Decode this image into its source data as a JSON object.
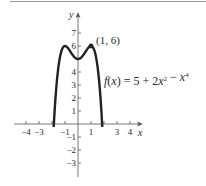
{
  "chart_data": {
    "type": "line",
    "title": "",
    "function_label": "f(x) = 5 + 2x² − x⁴",
    "xlabel": "x",
    "ylabel": "y",
    "xlim": [
      -4.5,
      5
    ],
    "ylim": [
      -4,
      8.5
    ],
    "x_ticks": [
      -4,
      -3,
      -2,
      -1,
      1,
      2,
      3,
      4
    ],
    "x_tick_labels": [
      {
        "value": -4,
        "label": "−4"
      },
      {
        "value": -3,
        "label": "−3"
      },
      {
        "value": -1,
        "label": "−1"
      },
      {
        "value": 1,
        "label": "1"
      },
      {
        "value": 3,
        "label": "3"
      },
      {
        "value": 4,
        "label": "4"
      }
    ],
    "y_ticks": [
      -3,
      -2,
      -1,
      1,
      2,
      3,
      4,
      5,
      6,
      7
    ],
    "y_tick_labels": [
      {
        "value": 7,
        "label": "7"
      },
      {
        "value": 6,
        "label": "6"
      },
      {
        "value": 4,
        "label": "4"
      },
      {
        "value": 3,
        "label": "3"
      },
      {
        "value": 2,
        "label": "2"
      },
      {
        "value": 1,
        "label": "1"
      },
      {
        "value": -1,
        "label": "−1"
      },
      {
        "value": -2,
        "label": "−2"
      },
      {
        "value": -3,
        "label": "−3"
      }
    ],
    "series": [
      {
        "name": "f(x) = 5 + 2x² − x⁴",
        "coefficients": {
          "c0": 5,
          "c2": 2,
          "c4": -1
        },
        "x_range": [
          -1.87,
          1.87
        ],
        "points": [
          {
            "x": -1.87,
            "y": -4.23
          },
          {
            "x": -1.5,
            "y": 4.44
          },
          {
            "x": -1,
            "y": 6
          },
          {
            "x": -0.5,
            "y": 5.44
          },
          {
            "x": 0,
            "y": 5
          },
          {
            "x": 0.5,
            "y": 5.44
          },
          {
            "x": 1,
            "y": 6
          },
          {
            "x": 1.5,
            "y": 4.44
          },
          {
            "x": 1.87,
            "y": -4.23
          }
        ],
        "color": "#222222"
      }
    ],
    "annotations": [
      {
        "x": 1,
        "y": 6,
        "label": "(1, 6)",
        "marker": "filled-dot"
      }
    ],
    "grid": false,
    "legend": null
  },
  "labels": {
    "point": "(1, 6)",
    "formula": "f(x) = 5 + 2x² − x⁴",
    "x_axis": "x",
    "y_axis": "y"
  },
  "layout": {
    "origin_px": [
      78,
      124
    ],
    "unit_px": 13,
    "y_axis_top_px": 12,
    "y_axis_bottom_px": 177,
    "x_axis_left_px": 14,
    "x_axis_right_px": 143
  },
  "colors": {
    "curve": "#222222",
    "axis": "#555555",
    "rule": "#9a9a9a"
  }
}
